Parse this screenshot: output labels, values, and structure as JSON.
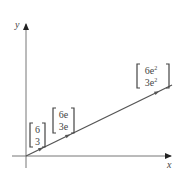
{
  "diagram": {
    "axes": {
      "x_label": "x",
      "y_label": "y"
    },
    "line": {
      "description": "Ray from origin through vectors scaled by powers of e",
      "color": "#555555"
    },
    "vectors": [
      {
        "top": "6",
        "bottom": "3"
      },
      {
        "top": "6e",
        "bottom": "3e"
      },
      {
        "top": "6e",
        "top_sup": "2",
        "bottom": "3e",
        "bottom_sup": "2"
      }
    ],
    "colors": {
      "axis": "#666666",
      "line": "#555555",
      "text": "#444444"
    }
  }
}
